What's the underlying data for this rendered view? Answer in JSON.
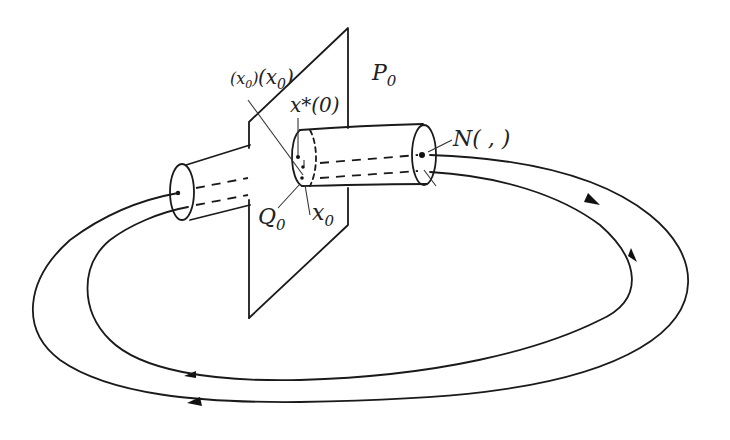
{
  "diagram": {
    "title": "",
    "colors": {
      "ink": "#1a1a1a",
      "background": "#ffffff"
    },
    "labels": {
      "plane": "P",
      "plane_sub": "0",
      "flow_label_a": "(x",
      "flow_label_a_sub": "0",
      "flow_label_a_close": ")",
      "flow_label_b": "(x",
      "flow_label_b_sub": "0",
      "flow_label_b_close": ")",
      "periodic_point": "x*(0)",
      "section": "Q",
      "section_sub": "0",
      "initial_point": "x",
      "initial_point_sub": "0",
      "neighborhood": "N( ,  )"
    },
    "elements": [
      "transversal plane P0",
      "tubular neighborhood (cylinder) around periodic orbit",
      "outer orbit loop with direction arrows",
      "inner orbit loop with direction arrows"
    ]
  }
}
